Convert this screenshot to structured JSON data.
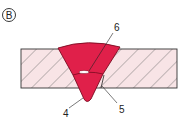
{
  "figure": {
    "marker": "B",
    "labels": {
      "four": "4",
      "five": "5",
      "six": "6"
    },
    "colors": {
      "weld": "#e0204a",
      "plate": "#f8e4e6",
      "hatch": "#555555"
    }
  }
}
